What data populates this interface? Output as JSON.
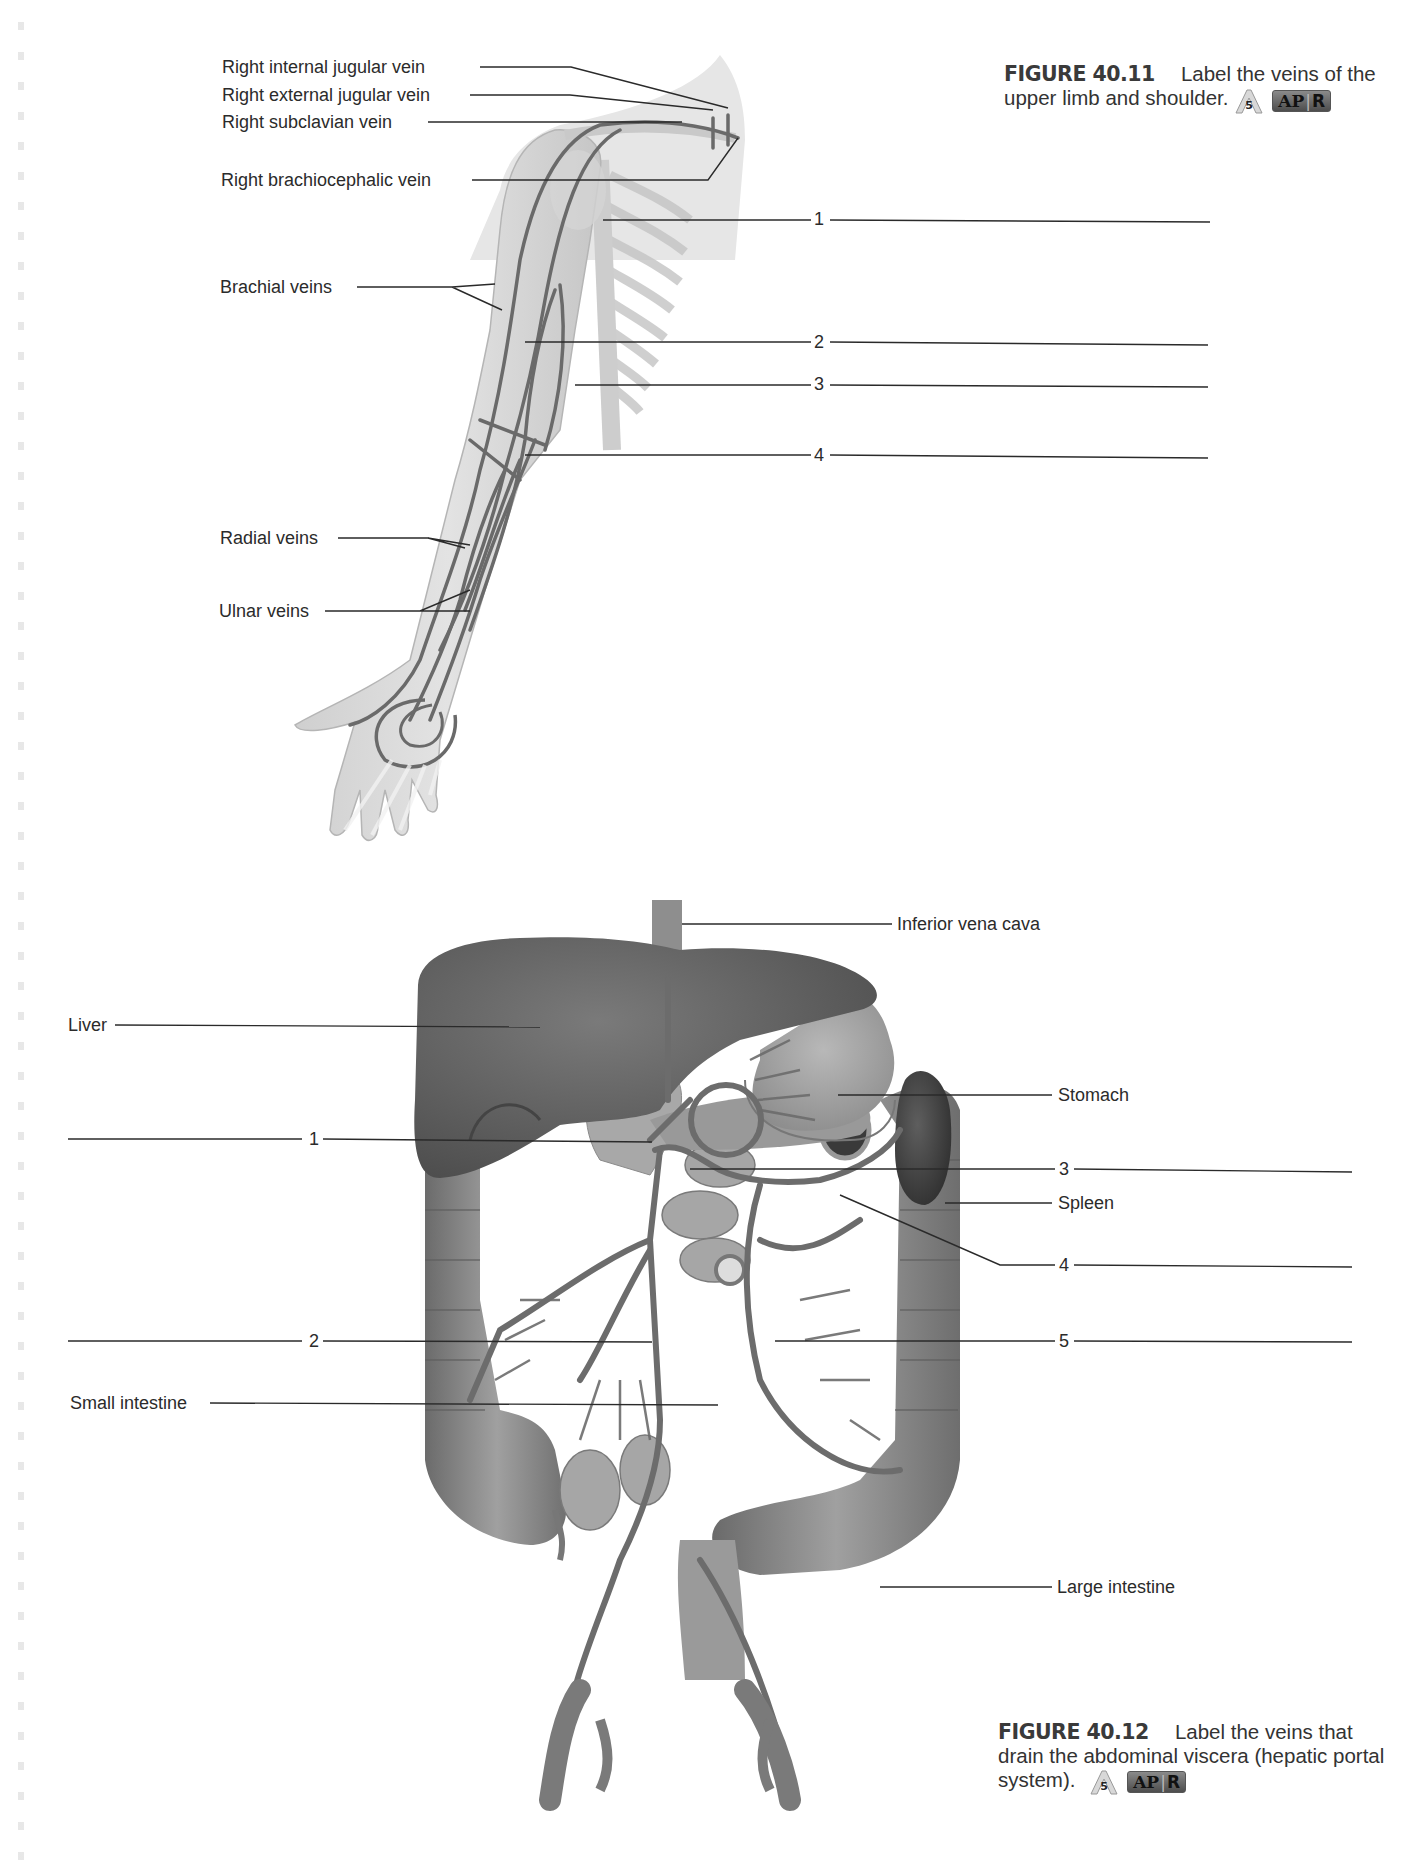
{
  "figure_40_11": {
    "number": "FIGURE 40.11",
    "caption": "Label the veins of the upper limb and shoulder.",
    "badge_level": "5",
    "badge_apr": "AP",
    "badge_r": "R",
    "given_labels": [
      "Right internal jugular vein",
      "Right external jugular vein",
      "Right subclavian vein",
      "Right brachiocephalic vein",
      "Brachial veins",
      "Radial veins",
      "Ulnar veins"
    ],
    "blank_labels": [
      "1",
      "2",
      "3",
      "4"
    ]
  },
  "figure_40_12": {
    "number": "FIGURE 40.12",
    "caption": "Label the veins that drain the abdominal viscera (hepatic portal system).",
    "badge_level": "5",
    "badge_apr": "AP",
    "badge_r": "R",
    "given_labels": [
      "Inferior vena cava",
      "Liver",
      "Stomach",
      "Spleen",
      "Small intestine",
      "Large intestine"
    ],
    "blank_labels": [
      "1",
      "2",
      "3",
      "4",
      "5"
    ]
  },
  "colors": {
    "text": "#2b2b2b",
    "leader_line": "#2a2a2a",
    "organ_dark": "#5a5a5a",
    "organ_mid": "#8c8c8c",
    "organ_light": "#b8b8b8",
    "vein": "#6a6a6a"
  }
}
